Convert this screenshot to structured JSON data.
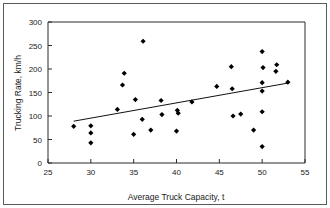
{
  "chart_data": {
    "type": "scatter",
    "title": "",
    "xlabel": "Average Truck Capacity, t",
    "ylabel": "Trucking Rate, km/h",
    "xlim": [
      25,
      55
    ],
    "ylim": [
      0,
      300
    ],
    "xticks": [
      25,
      30,
      35,
      40,
      45,
      50,
      55
    ],
    "yticks": [
      0,
      50,
      100,
      150,
      200,
      250,
      300
    ],
    "xtick_labels": [
      "25",
      "30",
      "35",
      "40",
      "45",
      "50",
      "55"
    ],
    "ytick_labels": [
      "0",
      "50",
      "100",
      "150",
      "200",
      "250",
      "300"
    ],
    "grid": false,
    "legend": null,
    "marker": "diamond",
    "marker_color": "#000000",
    "points": [
      {
        "x": 28.0,
        "y": 78
      },
      {
        "x": 30.0,
        "y": 79
      },
      {
        "x": 30.0,
        "y": 64
      },
      {
        "x": 30.0,
        "y": 43
      },
      {
        "x": 33.1,
        "y": 114
      },
      {
        "x": 33.7,
        "y": 166
      },
      {
        "x": 33.9,
        "y": 191
      },
      {
        "x": 35.0,
        "y": 61
      },
      {
        "x": 35.2,
        "y": 135
      },
      {
        "x": 36.0,
        "y": 93
      },
      {
        "x": 36.1,
        "y": 259
      },
      {
        "x": 37.0,
        "y": 70
      },
      {
        "x": 38.2,
        "y": 133
      },
      {
        "x": 38.3,
        "y": 103
      },
      {
        "x": 40.0,
        "y": 68
      },
      {
        "x": 40.1,
        "y": 112
      },
      {
        "x": 40.2,
        "y": 106
      },
      {
        "x": 41.8,
        "y": 130
      },
      {
        "x": 44.7,
        "y": 163
      },
      {
        "x": 46.4,
        "y": 205
      },
      {
        "x": 46.5,
        "y": 158
      },
      {
        "x": 46.6,
        "y": 100
      },
      {
        "x": 47.5,
        "y": 104
      },
      {
        "x": 49.0,
        "y": 70
      },
      {
        "x": 50.0,
        "y": 35
      },
      {
        "x": 50.0,
        "y": 109
      },
      {
        "x": 50.0,
        "y": 153
      },
      {
        "x": 50.0,
        "y": 171
      },
      {
        "x": 50.0,
        "y": 237
      },
      {
        "x": 50.1,
        "y": 203
      },
      {
        "x": 51.6,
        "y": 195
      },
      {
        "x": 51.7,
        "y": 209
      },
      {
        "x": 53.0,
        "y": 172
      }
    ],
    "trend_line": {
      "x_start": 28.0,
      "y_start": 89,
      "x_end": 53.0,
      "y_end": 170
    }
  }
}
